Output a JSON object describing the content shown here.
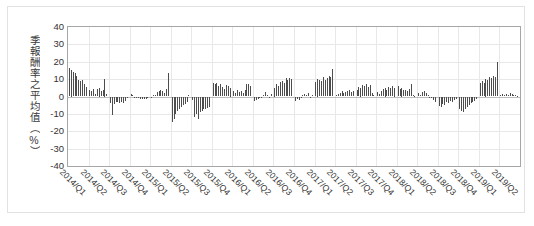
{
  "chart_data": {
    "type": "bar",
    "title": "",
    "subtitle": "",
    "xlabel": "",
    "ylabel": "季報酬率之平均值（%）",
    "ylim": [
      -40,
      40
    ],
    "ytick_step": 10,
    "yticks": [
      "40",
      "30",
      "20",
      "10",
      "0",
      "-10",
      "-20",
      "-30",
      "-40"
    ],
    "grid": true,
    "grid_axis": "both",
    "legend": "none",
    "bar_color": "#4d4d4d",
    "categories": [
      "2014/Q1",
      "2014/Q2",
      "2014/Q3",
      "2014/Q4",
      "2015/Q1",
      "2015/Q2",
      "2015/Q3",
      "2015/Q4",
      "2016/Q1",
      "2016/Q2",
      "2016/Q3",
      "2016/Q4",
      "2017/Q1",
      "2017/Q2",
      "2017/Q3",
      "2017/Q4",
      "2018/Q1",
      "2018/Q2",
      "2018/Q3",
      "2018/Q4",
      "2019/Q1",
      "2019/Q2"
    ],
    "note": "Each quarter contains ~10 individual bars (one per sub-series); values are the per-bar quarterly mean returns in percent.",
    "series": [
      {
        "name": "季報酬率之平均值",
        "groups": [
          {
            "category": "2014/Q1",
            "values": [
              16.2,
              15.0,
              14.3,
              13.6,
              12.0,
              9.6,
              9.0,
              9.6,
              7.2,
              5.2
            ]
          },
          {
            "category": "2014/Q2",
            "values": [
              4.0,
              3.4,
              4.2,
              1.6,
              4.2,
              5.0,
              3.2,
              4.0,
              10.0,
              1.2
            ]
          },
          {
            "category": "2014/Q3",
            "values": [
              -4.0,
              -10.8,
              -4.6,
              -3.4,
              -3.0,
              -4.0,
              -3.2,
              -3.6,
              -2.6,
              -0.6
            ]
          },
          {
            "category": "2014/Q4",
            "values": [
              1.6,
              0.6,
              -0.4,
              -1.0,
              -0.6,
              -1.2,
              -1.4,
              -1.6,
              -1.2,
              -0.8
            ]
          },
          {
            "category": "2015/Q1",
            "values": [
              -1.0,
              0.6,
              1.0,
              2.6,
              3.2,
              4.0,
              3.0,
              2.0,
              4.6,
              13.8
            ]
          },
          {
            "category": "2015/Q2",
            "values": [
              -14.6,
              -13.0,
              -10.0,
              -8.2,
              -7.0,
              -6.0,
              -5.0,
              -4.2,
              -3.0,
              0.8
            ]
          },
          {
            "category": "2015/Q3",
            "values": [
              -2.0,
              -11.6,
              -10.2,
              -12.8,
              -9.0,
              -8.2,
              -7.4,
              -7.0,
              -6.6,
              -6.0
            ]
          },
          {
            "category": "2015/Q4",
            "values": [
              7.6,
              7.0,
              8.0,
              6.0,
              7.4,
              5.6,
              4.6,
              6.8,
              6.2,
              5.0
            ]
          },
          {
            "category": "2016/Q1",
            "values": [
              3.2,
              2.0,
              3.6,
              2.6,
              3.4,
              2.2,
              4.0,
              7.2,
              7.0,
              6.0
            ]
          },
          {
            "category": "2016/Q2",
            "values": [
              -2.4,
              -2.0,
              -1.6,
              -1.0,
              -0.6,
              1.0,
              2.6,
              0.6,
              -0.4,
              1.4
            ]
          },
          {
            "category": "2016/Q3",
            "values": [
              5.0,
              7.0,
              6.0,
              8.4,
              9.0,
              7.6,
              10.4,
              9.6,
              10.6,
              10.2
            ]
          },
          {
            "category": "2016/Q4",
            "values": [
              -2.4,
              -1.6,
              -2.0,
              -0.6,
              0.6,
              1.4,
              1.0,
              1.8,
              -0.4,
              0.8
            ]
          },
          {
            "category": "2017/Q1",
            "values": [
              8.4,
              10.0,
              9.4,
              9.0,
              11.0,
              9.6,
              10.4,
              12.0,
              11.4,
              15.8
            ]
          },
          {
            "category": "2017/Q2",
            "values": [
              1.0,
              1.6,
              2.0,
              3.4,
              1.8,
              2.6,
              3.2,
              4.0,
              2.4,
              3.0
            ]
          },
          {
            "category": "2017/Q3",
            "values": [
              4.0,
              5.6,
              5.0,
              6.8,
              6.0,
              7.4,
              5.2,
              6.4,
              2.0,
              1.0
            ]
          },
          {
            "category": "2017/Q4",
            "values": [
              2.6,
              1.6,
              3.0,
              4.6,
              5.0,
              4.0,
              5.6,
              4.8,
              6.0,
              5.0
            ]
          },
          {
            "category": "2018/Q1",
            "values": [
              6.0,
              4.4,
              5.0,
              3.6,
              4.0,
              3.0,
              4.2,
              7.2,
              1.0,
              0.4
            ]
          },
          {
            "category": "2018/Q2",
            "values": [
              2.0,
              1.0,
              2.6,
              3.0,
              2.2,
              1.0,
              -0.6,
              -1.0,
              -2.0,
              -3.0
            ]
          },
          {
            "category": "2018/Q3",
            "values": [
              -5.6,
              -6.0,
              -4.4,
              -5.0,
              -3.0,
              -4.0,
              -2.6,
              -3.4,
              -2.0,
              -1.4
            ]
          },
          {
            "category": "2018/Q4",
            "values": [
              -7.4,
              -8.4,
              -9.0,
              -7.0,
              -6.0,
              -5.0,
              -4.0,
              -3.4,
              -2.6,
              -1.6
            ]
          },
          {
            "category": "2019/Q1",
            "values": [
              8.0,
              9.0,
              7.6,
              10.0,
              9.4,
              11.0,
              10.4,
              12.0,
              11.4,
              19.6
            ]
          },
          {
            "category": "2019/Q2",
            "values": [
              0.6,
              1.4,
              0.8,
              1.6,
              1.0,
              1.8,
              1.2,
              0.6,
              1.0,
              0.4
            ]
          }
        ]
      }
    ]
  }
}
